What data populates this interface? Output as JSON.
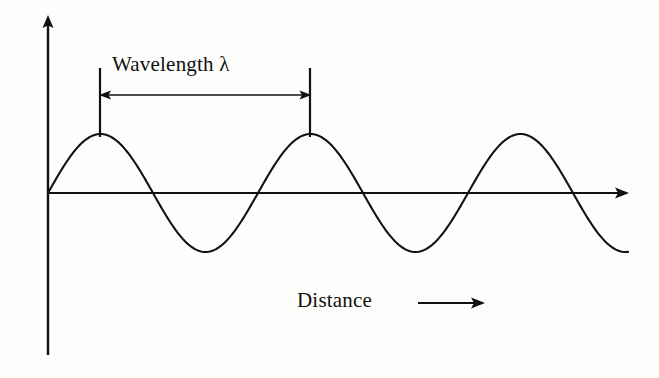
{
  "figure": {
    "background_color": "#fdfdfb",
    "ink_color": "#111111"
  },
  "labels": {
    "wavelength": "Wavelength λ",
    "distance": "Distance",
    "lambda_symbol": "λ"
  },
  "axes": {
    "y_axis": {
      "name": "amplitude-axis",
      "x": 48,
      "top": 18,
      "bottom": 355,
      "arrow": "up"
    },
    "x_axis": {
      "name": "distance-axis",
      "y": 193,
      "left": 48,
      "right": 628,
      "arrow": "right"
    }
  },
  "annotation": {
    "measure_arrow": {
      "y": 95,
      "x_start": 100,
      "x_end": 310,
      "heads": "both",
      "tick_top": 68,
      "tick_bottom": 137
    },
    "distance_arrow": {
      "y": 303,
      "x_start": 418,
      "x_end": 484,
      "heads": "right"
    }
  },
  "chart_data": {
    "type": "line",
    "title": "Wavelength λ",
    "xlabel": "Distance",
    "ylabel": "",
    "grid": false,
    "legend": null,
    "annotations": [
      {
        "text": "Wavelength λ",
        "x_start": 100,
        "x_end": 310,
        "kind": "double-headed-measure-arrow"
      },
      {
        "text": "Distance",
        "kind": "axis-direction-arrow",
        "direction": "right"
      }
    ],
    "wave": {
      "form": "sine",
      "amplitude_px": 59,
      "wavelength_px": 210,
      "baseline_y_px": 193,
      "x_start_px": 48,
      "x_end_px": 628,
      "cycles": 2.76,
      "peaks_x_px": [
        100,
        310,
        513
      ],
      "troughs_x_px": [
        205,
        415,
        620
      ],
      "zero_crossings_x_px": [
        48,
        153,
        258,
        363,
        468,
        573
      ]
    },
    "x": [
      48,
      58,
      68,
      78,
      88,
      100,
      112,
      122,
      132,
      142,
      153,
      163,
      173,
      183,
      195,
      205,
      217,
      227,
      237,
      247,
      258,
      268,
      278,
      288,
      300,
      310,
      322,
      332,
      342,
      352,
      363,
      373,
      383,
      393,
      405,
      415,
      427,
      437,
      447,
      457,
      468,
      478,
      488,
      498,
      510,
      513,
      525,
      535,
      545,
      555,
      573,
      585,
      595,
      605,
      620,
      628
    ],
    "y": [
      193,
      175,
      158,
      145,
      137,
      134,
      137,
      145,
      158,
      175,
      193,
      211,
      228,
      241,
      249,
      252,
      249,
      241,
      228,
      211,
      193,
      175,
      158,
      145,
      137,
      134,
      137,
      145,
      158,
      175,
      193,
      211,
      228,
      241,
      249,
      252,
      249,
      241,
      228,
      211,
      193,
      175,
      158,
      145,
      136,
      135,
      140,
      150,
      163,
      179,
      193,
      215,
      231,
      242,
      250,
      251
    ]
  }
}
